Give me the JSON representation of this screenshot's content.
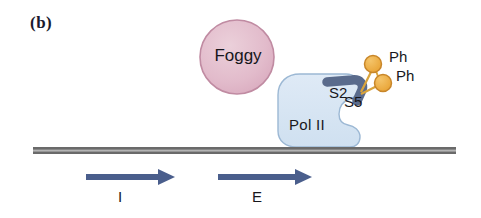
{
  "figure": {
    "panel_label": "(b)",
    "background_color": "#ffffff"
  },
  "factor": {
    "name": "Foggy",
    "shape": "circle",
    "fill_color": "#e3bccb",
    "stroke_color": "#c08ba2",
    "center": [
      237,
      57
    ],
    "radius": 37
  },
  "polymerase": {
    "label": "Pol II",
    "fill_color": "#d6e4f2",
    "stroke_color": "#9cb8d4",
    "ctd_tail": {
      "color": "#5a6b8c",
      "name": "ctd-tail"
    },
    "phospho_sites": [
      {
        "label": "S2",
        "name": "serine-2-site"
      },
      {
        "label": "S5",
        "name": "serine-5-site"
      }
    ]
  },
  "phosphate_groups": {
    "fill_color": "#eeab3f",
    "stroke_color": "#c8862a",
    "link_color": "#d9a43c",
    "labels": [
      "Ph",
      "Ph"
    ]
  },
  "dna": {
    "name": "dna-double-strand",
    "color_outer": "#5b5b5b",
    "color_inner": "#a8a8a8",
    "x_start": 33,
    "x_end": 456,
    "y": 150
  },
  "arrows": [
    {
      "label": "I",
      "name": "initiation-arrow",
      "color": "#4a5e8c",
      "x_start": 86,
      "x_end": 173,
      "y": 177
    },
    {
      "label": "E",
      "name": "elongation-arrow",
      "color": "#4a5e8c",
      "x_start": 218,
      "x_end": 311,
      "y": 177
    }
  ]
}
